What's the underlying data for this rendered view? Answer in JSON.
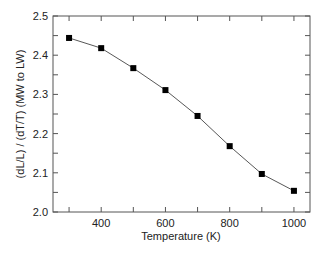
{
  "chart_data": {
    "type": "line",
    "title": "",
    "xlabel": "Temperature (K)",
    "ylabel": "(dL/L) / (dT/T) (MW to LW)",
    "x": [
      300,
      400,
      500,
      600,
      700,
      800,
      900,
      1000
    ],
    "series": [
      {
        "name": "(dL/L)/(dT/T)",
        "values": [
          2.444,
          2.418,
          2.367,
          2.311,
          2.245,
          2.168,
          2.097,
          2.054
        ],
        "marker": "square",
        "color": "#000000"
      }
    ],
    "xlim": [
      250,
      1050
    ],
    "ylim": [
      2.0,
      2.5
    ],
    "xticks": [
      400,
      600,
      800,
      1000
    ],
    "xtick_labels": [
      "400",
      "600",
      "800",
      "1000"
    ],
    "yticks": [
      2.0,
      2.1,
      2.2,
      2.3,
      2.4,
      2.5
    ],
    "ytick_labels": [
      "2.0",
      "2.1",
      "2.2",
      "2.3",
      "2.4",
      "2.5"
    ],
    "grid": false,
    "legend": null
  }
}
